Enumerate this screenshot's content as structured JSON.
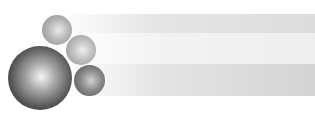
{
  "graphic": {
    "description": "Decorative banner with grayscale spheres and fading horizontal bands",
    "colors": {
      "background": "#ffffff",
      "band_light": "#dcdcdc",
      "band_lighter": "#eeeeee",
      "band_mid": "#d4d4d4",
      "sphere_dark": "#1e1e1e",
      "sphere_highlight": "#f4f4f4"
    },
    "spheres": [
      {
        "name": "large",
        "cx": 40,
        "cy": 78,
        "r": 32
      },
      {
        "name": "top",
        "cx": 57,
        "cy": 30,
        "r": 15
      },
      {
        "name": "middle",
        "cx": 81,
        "cy": 50,
        "r": 15
      },
      {
        "name": "lower",
        "cx": 89,
        "cy": 80,
        "r": 15
      }
    ],
    "bands": 3
  }
}
